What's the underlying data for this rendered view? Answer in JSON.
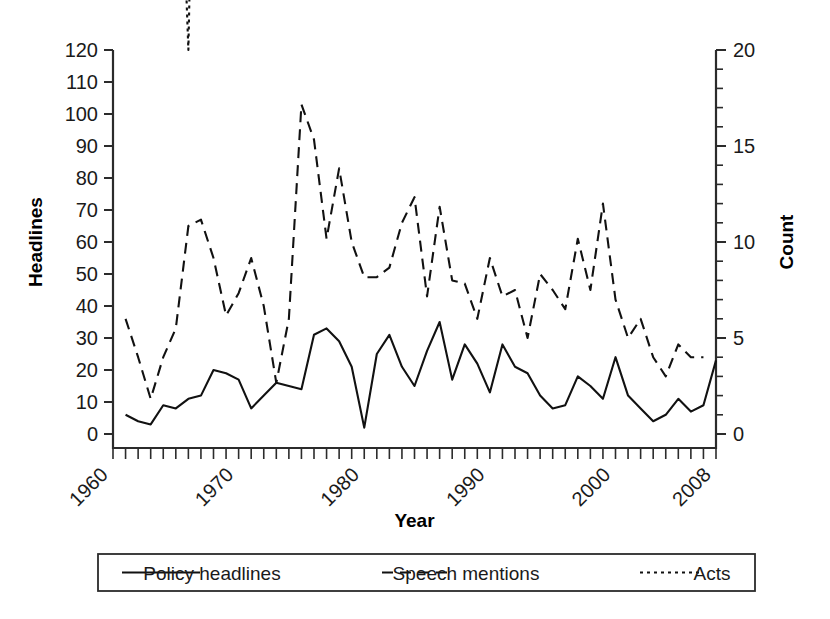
{
  "chart_data": {
    "type": "line",
    "title": "",
    "xlabel": "Year",
    "ylabel": "Headlines",
    "y2label": "Count",
    "xlim": [
      1960,
      2008
    ],
    "ylim": [
      0,
      120
    ],
    "y2lim": [
      0,
      20
    ],
    "grid": false,
    "legend_position": "bottom",
    "x_ticks_major": [
      1960,
      1970,
      1980,
      1990,
      2000,
      2008
    ],
    "x_tick_labels": [
      "1960",
      "1970",
      "1980",
      "1990",
      "2000",
      "2008"
    ],
    "y_ticks": [
      0,
      10,
      20,
      30,
      40,
      50,
      60,
      70,
      80,
      90,
      100,
      110,
      120
    ],
    "y_tick_labels": [
      "0",
      "10",
      "20",
      "30",
      "40",
      "50",
      "60",
      "70",
      "80",
      "90",
      "100",
      "110",
      "120"
    ],
    "y2_ticks": [
      0,
      5,
      10,
      15,
      20
    ],
    "y2_tick_labels": [
      "0",
      "5",
      "10",
      "15",
      "20"
    ],
    "x": [
      1961,
      1962,
      1963,
      1964,
      1965,
      1966,
      1967,
      1968,
      1969,
      1970,
      1971,
      1972,
      1973,
      1974,
      1975,
      1976,
      1977,
      1978,
      1979,
      1980,
      1981,
      1982,
      1983,
      1984,
      1985,
      1986,
      1987,
      1988,
      1989,
      1990,
      1991,
      1992,
      1993,
      1994,
      1995,
      1996,
      1997,
      1998,
      1999,
      2000,
      2001,
      2002,
      2003,
      2004,
      2005,
      2006,
      2007,
      2008
    ],
    "series": [
      {
        "name": "Policy headlines",
        "axis": "left",
        "style": "solid",
        "values": [
          6,
          4,
          3,
          9,
          8,
          11,
          12,
          20,
          19,
          17,
          8,
          12,
          16,
          15,
          14,
          31,
          33,
          29,
          21,
          2,
          25,
          31,
          21,
          15,
          26,
          35,
          17,
          28,
          22,
          13,
          28,
          21,
          19,
          12,
          8,
          9,
          18,
          15,
          11,
          24,
          12,
          8,
          4,
          6,
          11,
          7,
          9,
          23
        ]
      },
      {
        "name": "Speech mentions",
        "axis": "left",
        "style": "dashed",
        "values": [
          36,
          24,
          11,
          24,
          33,
          65,
          67,
          55,
          37,
          44,
          55,
          40,
          16,
          36,
          103,
          92,
          61,
          83,
          60,
          49,
          49,
          52,
          66,
          74,
          43,
          71,
          48,
          47,
          36,
          55,
          43,
          45,
          30,
          50,
          45,
          39,
          61,
          45,
          72,
          42,
          30,
          36,
          24,
          18,
          28,
          24,
          24,
          null
        ]
      },
      {
        "name": "Acts",
        "axis": "right",
        "style": "dotted",
        "values": [
          24,
          40,
          28,
          36,
          38,
          20,
          53,
          63,
          54,
          96,
          46,
          60,
          26,
          46,
          114,
          54,
          41,
          41,
          42,
          43,
          46,
          62,
          46,
          68,
          77,
          50,
          40,
          32,
          58,
          66,
          61,
          39,
          30,
          31,
          44,
          42,
          41,
          29,
          43,
          43,
          43,
          32,
          36,
          48,
          34,
          36,
          36,
          null
        ]
      }
    ]
  },
  "axes": {
    "left_title": "Headlines",
    "right_title": "Count",
    "bottom_title": "Year"
  },
  "legend": {
    "entries": [
      {
        "label": "Policy headlines",
        "style": "solid"
      },
      {
        "label": "Speech mentions",
        "style": "dashed"
      },
      {
        "label": "Acts",
        "style": "dotted"
      }
    ]
  },
  "colors": {
    "background": "#ffffff",
    "ink": "#111111",
    "axis": "#2b2b2b"
  }
}
